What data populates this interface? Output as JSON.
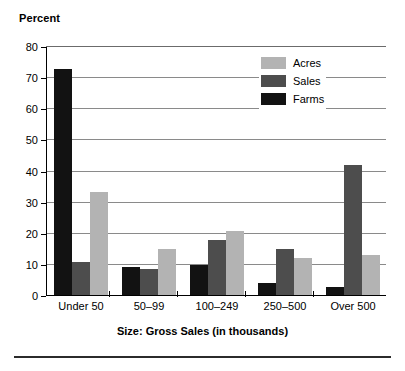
{
  "chart_data": {
    "type": "bar",
    "title": "",
    "ylabel": "Percent",
    "xlabel": "Size: Gross Sales (in thousands)",
    "categories": [
      "Under 50",
      "50–99",
      "100–249",
      "250–500",
      "Over 500"
    ],
    "series": [
      {
        "name": "Farms",
        "color": "#121212",
        "values": [
          73.0,
          9.2,
          10.0,
          4.2,
          2.8
        ]
      },
      {
        "name": "Sales",
        "color": "#4d4d4d",
        "values": [
          11.0,
          8.8,
          18.0,
          15.2,
          42.0
        ]
      },
      {
        "name": "Acres",
        "color": "#b3b3b3",
        "values": [
          33.5,
          15.0,
          21.0,
          12.2,
          13.3
        ]
      }
    ],
    "series_draw_order": [
      "Farms",
      "Sales",
      "Acres"
    ],
    "legend_order": [
      "Acres",
      "Sales",
      "Farms"
    ],
    "legend_position": "top-right inside plot",
    "ylim": [
      0,
      80
    ],
    "yticks": [
      0,
      10,
      20,
      30,
      40,
      50,
      60,
      70,
      80
    ],
    "ytick_labels": [
      "0",
      "10",
      "20",
      "30",
      "40",
      "50",
      "60",
      "70",
      "80"
    ],
    "grid": "horizontal"
  },
  "axes": {
    "y_title": "Percent",
    "x_title": "Size: Gross Sales (in thousands)"
  },
  "legend": {
    "items": [
      {
        "label": "Acres"
      },
      {
        "label": "Sales"
      },
      {
        "label": "Farms"
      }
    ]
  }
}
